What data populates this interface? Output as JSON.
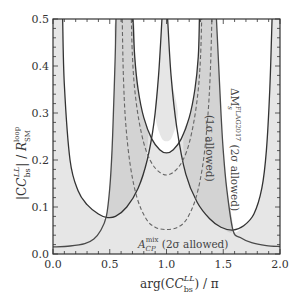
{
  "chart_data": {
    "type": "line",
    "title": "",
    "xlabel": "arg(C_bs^LL) / π",
    "ylabel": "|C_bs^LL| / R_SM^loop",
    "xlim": [
      0.0,
      2.0
    ],
    "ylim": [
      0.0,
      0.5
    ],
    "grid": false,
    "legend": null,
    "x_ticks": [
      "0.0",
      "0.5",
      "1.0",
      "1.5",
      "2.0"
    ],
    "y_ticks": [
      "0.0",
      "0.1",
      "0.2",
      "0.3",
      "0.4",
      "0.5"
    ],
    "annotations": [
      {
        "text": "A_CP^mix (2σ allowed)",
        "x": 0.95,
        "y": 0.03,
        "rotation": 0
      },
      {
        "text": "ΔM_s^FLAG2017 (2σ allowed)",
        "x": 1.58,
        "y": 0.36,
        "rotation": 90
      },
      {
        "text": "(1σ allowed)",
        "x": 1.36,
        "y": 0.28,
        "rotation": 90
      }
    ],
    "series": [
      {
        "name": "DeltaMs 2sigma bound (left U)",
        "style": "solid",
        "points": [
          [
            0.085,
            0.5
          ],
          [
            0.1,
            0.36
          ],
          [
            0.15,
            0.2
          ],
          [
            0.22,
            0.135
          ],
          [
            0.3,
            0.105
          ],
          [
            0.4,
            0.085
          ],
          [
            0.47,
            0.078
          ],
          [
            0.55,
            0.08
          ],
          [
            0.65,
            0.1
          ],
          [
            0.75,
            0.14
          ],
          [
            0.83,
            0.2
          ],
          [
            0.89,
            0.28
          ],
          [
            0.93,
            0.38
          ],
          [
            0.96,
            0.5
          ]
        ]
      },
      {
        "name": "DeltaMs 2sigma bound (right U)",
        "style": "solid",
        "points": [
          [
            1.01,
            0.5
          ],
          [
            1.04,
            0.38
          ],
          [
            1.09,
            0.27
          ],
          [
            1.17,
            0.17
          ],
          [
            1.27,
            0.11
          ],
          [
            1.38,
            0.075
          ],
          [
            1.48,
            0.057
          ],
          [
            1.585,
            0.051
          ],
          [
            1.68,
            0.06
          ],
          [
            1.77,
            0.085
          ],
          [
            1.84,
            0.14
          ],
          [
            1.88,
            0.22
          ],
          [
            1.91,
            0.35
          ],
          [
            1.93,
            0.5
          ]
        ]
      },
      {
        "name": "DeltaMs 2sigma bound (center U)",
        "style": "solid",
        "points": [
          [
            0.705,
            0.5
          ],
          [
            0.72,
            0.42
          ],
          [
            0.75,
            0.35
          ],
          [
            0.8,
            0.29
          ],
          [
            0.87,
            0.245
          ],
          [
            0.94,
            0.222
          ],
          [
            1.0,
            0.215
          ],
          [
            1.06,
            0.222
          ],
          [
            1.13,
            0.245
          ],
          [
            1.2,
            0.29
          ],
          [
            1.25,
            0.35
          ],
          [
            1.28,
            0.42
          ],
          [
            1.29,
            0.5
          ]
        ]
      },
      {
        "name": "A_CP^mix 2sigma bound (left)",
        "style": "solid",
        "points": [
          [
            0.0,
            0.015
          ],
          [
            0.15,
            0.017
          ],
          [
            0.28,
            0.022
          ],
          [
            0.36,
            0.032
          ],
          [
            0.42,
            0.05
          ],
          [
            0.47,
            0.08
          ],
          [
            0.5,
            0.14
          ],
          [
            0.52,
            0.22
          ],
          [
            0.535,
            0.32
          ],
          [
            0.548,
            0.42
          ],
          [
            0.555,
            0.5
          ]
        ]
      },
      {
        "name": "A_CP^mix 2sigma bound (right)",
        "style": "solid",
        "points": [
          [
            1.44,
            0.5
          ],
          [
            1.46,
            0.4
          ],
          [
            1.48,
            0.3
          ],
          [
            1.5,
            0.22
          ],
          [
            1.53,
            0.14
          ],
          [
            1.585,
            0.051
          ],
          [
            1.65,
            0.035
          ],
          [
            1.75,
            0.024
          ],
          [
            1.88,
            0.018
          ],
          [
            2.0,
            0.016
          ]
        ]
      },
      {
        "name": "DeltaMs 1sigma bound (inner dashed U)",
        "style": "dashed",
        "points": [
          [
            0.69,
            0.5
          ],
          [
            0.7,
            0.42
          ],
          [
            0.72,
            0.35
          ],
          [
            0.76,
            0.28
          ],
          [
            0.82,
            0.22
          ],
          [
            0.9,
            0.183
          ],
          [
            1.0,
            0.168
          ],
          [
            1.1,
            0.183
          ],
          [
            1.18,
            0.22
          ],
          [
            1.24,
            0.28
          ],
          [
            1.28,
            0.35
          ],
          [
            1.3,
            0.42
          ],
          [
            1.31,
            0.5
          ]
        ]
      },
      {
        "name": "DeltaMs 1sigma bound (outer dashed U)",
        "style": "dashed",
        "points": [
          [
            0.61,
            0.5
          ],
          [
            0.62,
            0.38
          ],
          [
            0.64,
            0.28
          ],
          [
            0.68,
            0.19
          ],
          [
            0.74,
            0.12
          ],
          [
            0.82,
            0.075
          ],
          [
            0.9,
            0.057
          ],
          [
            1.0,
            0.052
          ],
          [
            1.1,
            0.057
          ],
          [
            1.18,
            0.075
          ],
          [
            1.26,
            0.12
          ],
          [
            1.32,
            0.19
          ],
          [
            1.36,
            0.28
          ],
          [
            1.385,
            0.38
          ],
          [
            1.4,
            0.5
          ]
        ]
      }
    ],
    "regions": [
      {
        "name": "white-left",
        "fill": "#ffffff",
        "points": [
          [
            0.085,
            0.5
          ],
          [
            0.1,
            0.36
          ],
          [
            0.15,
            0.2
          ],
          [
            0.22,
            0.135
          ],
          [
            0.3,
            0.105
          ],
          [
            0.4,
            0.085
          ],
          [
            0.47,
            0.078
          ],
          [
            0.5,
            0.14
          ],
          [
            0.52,
            0.22
          ],
          [
            0.535,
            0.32
          ],
          [
            0.548,
            0.42
          ],
          [
            0.555,
            0.5
          ]
        ]
      },
      {
        "name": "white-right",
        "fill": "#ffffff",
        "points": [
          [
            1.44,
            0.5
          ],
          [
            1.46,
            0.4
          ],
          [
            1.48,
            0.3
          ],
          [
            1.5,
            0.22
          ],
          [
            1.53,
            0.14
          ],
          [
            1.585,
            0.051
          ],
          [
            1.68,
            0.06
          ],
          [
            1.77,
            0.085
          ],
          [
            1.84,
            0.14
          ],
          [
            1.88,
            0.22
          ],
          [
            1.91,
            0.35
          ],
          [
            1.93,
            0.5
          ]
        ]
      },
      {
        "name": "white-center",
        "fill": "#ffffff",
        "points": [
          [
            0.705,
            0.5
          ],
          [
            0.72,
            0.42
          ],
          [
            0.75,
            0.35
          ],
          [
            0.8,
            0.29
          ],
          [
            0.87,
            0.245
          ],
          [
            0.94,
            0.222
          ],
          [
            1.0,
            0.215
          ],
          [
            1.06,
            0.222
          ],
          [
            1.13,
            0.245
          ],
          [
            1.2,
            0.29
          ],
          [
            1.25,
            0.35
          ],
          [
            1.28,
            0.42
          ],
          [
            1.29,
            0.5
          ]
        ]
      },
      {
        "name": "center-strip",
        "fill": "#e6e6e6",
        "points": [
          [
            0.96,
            0.5
          ],
          [
            0.93,
            0.38
          ],
          [
            0.9,
            0.3
          ],
          [
            0.95,
            0.25
          ],
          [
            1.0,
            0.24
          ],
          [
            1.05,
            0.25
          ],
          [
            1.1,
            0.3
          ],
          [
            1.04,
            0.38
          ],
          [
            1.01,
            0.5
          ]
        ]
      },
      {
        "name": "dark-band-left",
        "fill": "#d3d3d3",
        "points": [
          [
            0.47,
            0.078
          ],
          [
            0.5,
            0.14
          ],
          [
            0.52,
            0.22
          ],
          [
            0.535,
            0.32
          ],
          [
            0.548,
            0.42
          ],
          [
            0.555,
            0.5
          ],
          [
            0.705,
            0.5
          ],
          [
            0.72,
            0.42
          ],
          [
            0.75,
            0.35
          ],
          [
            0.8,
            0.29
          ],
          [
            0.84,
            0.255
          ],
          [
            0.8,
            0.17
          ],
          [
            0.75,
            0.14
          ],
          [
            0.65,
            0.1
          ],
          [
            0.55,
            0.08
          ]
        ]
      },
      {
        "name": "dark-band-right",
        "fill": "#d3d3d3",
        "points": [
          [
            1.29,
            0.5
          ],
          [
            1.28,
            0.42
          ],
          [
            1.25,
            0.35
          ],
          [
            1.2,
            0.29
          ],
          [
            1.15,
            0.255
          ],
          [
            1.17,
            0.17
          ],
          [
            1.27,
            0.11
          ],
          [
            1.38,
            0.075
          ],
          [
            1.48,
            0.057
          ],
          [
            1.585,
            0.051
          ],
          [
            1.53,
            0.14
          ],
          [
            1.5,
            0.22
          ],
          [
            1.48,
            0.3
          ],
          [
            1.46,
            0.4
          ],
          [
            1.44,
            0.5
          ]
        ]
      }
    ],
    "colors": {
      "background_fill": "#e6e6e6",
      "dark_band": "#d3d3d3",
      "line_main": "#333333",
      "line_acp": "#4a4a4a",
      "line_dashed": "#666666",
      "frame": "#333333"
    }
  },
  "labels": {
    "y_axis_title": "|C",
    "x_axis_title": "arg(C",
    "annot_acp": "A",
    "annot_acp_rest": " (2σ allowed)",
    "annot_dms": "ΔM",
    "annot_dms_rest": " (2σ allowed)",
    "annot_1sigma": "(1σ allowed)"
  }
}
